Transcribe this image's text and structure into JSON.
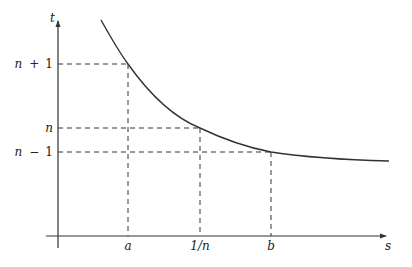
{
  "diagram": {
    "type": "function-graph",
    "axes": {
      "x_label": "s",
      "y_label": "t"
    },
    "y_ticks": [
      {
        "label_main": "n",
        "label_op": "+",
        "label_num": "1",
        "full": "n + 1",
        "y": 64
      },
      {
        "label_main": "n",
        "label_op": "",
        "label_num": "",
        "full": "n",
        "y": 128
      },
      {
        "label_main": "n",
        "label_op": "−",
        "label_num": "1",
        "full": "n − 1",
        "y": 152
      }
    ],
    "x_ticks": [
      {
        "label": "a",
        "x": 128
      },
      {
        "label": "1/n",
        "x": 200
      },
      {
        "label": "b",
        "x": 271
      }
    ],
    "curve": {
      "shape": "decreasing convex",
      "start": [
        101,
        20
      ],
      "end": [
        389,
        161
      ]
    },
    "colors": {
      "ink": "#333333",
      "background": "#ffffff"
    }
  }
}
